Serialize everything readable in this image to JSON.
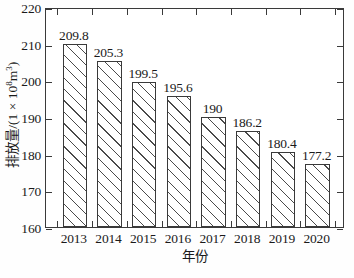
{
  "chart_data": {
    "type": "bar",
    "title": "",
    "categories": [
      "2013",
      "2014",
      "2015",
      "2016",
      "2017",
      "2018",
      "2019",
      "2020"
    ],
    "values": [
      209.8,
      205.3,
      199.5,
      195.6,
      190,
      186.2,
      180.4,
      177.2
    ],
    "value_labels": [
      "209.8",
      "205.3",
      "199.5",
      "195.6",
      "190",
      "186.2",
      "180.4",
      "177.2"
    ],
    "xlabel": "年份",
    "ylabel_prefix": "排放量/(1 × 10",
    "ylabel_exponent": "8",
    "ylabel_suffix": "m",
    "ylabel_suffix_exponent": "3",
    "ylabel_close": ")",
    "ylabel_full": "排放量/(1 × 10⁸m³)",
    "ylim": [
      160,
      220
    ],
    "yticks": [
      "160",
      "170",
      "180",
      "190",
      "200",
      "210",
      "220"
    ],
    "ytick_values": [
      160,
      170,
      180,
      190,
      200,
      210,
      220
    ],
    "grid": false,
    "legend": false,
    "bar_fill": "#ffffff",
    "bar_hatch": "forward-diagonal",
    "bar_edge_color": "#3a3a3a",
    "axis_color": "#3a3a3a",
    "background": "#ffffff"
  }
}
